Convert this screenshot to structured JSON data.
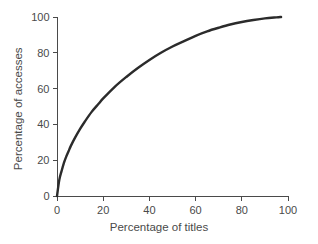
{
  "chart_data": {
    "type": "line",
    "title": "",
    "subtitle": "",
    "xlabel": "Percentage of titles",
    "ylabel": "Percentage of accesses",
    "xlim": [
      0,
      100
    ],
    "ylim": [
      0,
      100
    ],
    "xticks": [
      0,
      20,
      40,
      60,
      80,
      100
    ],
    "yticks": [
      0,
      20,
      40,
      60,
      80,
      100
    ],
    "xtick_labels": [
      "0",
      "20",
      "40",
      "60",
      "80",
      "100"
    ],
    "ytick_labels": [
      "0",
      "20",
      "40",
      "60",
      "80",
      "100"
    ],
    "grid": false,
    "legend": false,
    "legend_position": "none",
    "annotations": [],
    "line_color": "#2b2b2b",
    "line_width": 2.4,
    "background_color": "#ffffff",
    "axis_color": "#4a4a4a",
    "series": [
      {
        "name": "Cumulative accesses",
        "x": [
          0,
          1,
          2,
          3,
          4,
          5,
          6,
          8,
          10,
          12,
          15,
          18,
          20,
          25,
          30,
          35,
          40,
          45,
          50,
          55,
          60,
          65,
          70,
          75,
          80,
          85,
          90,
          95,
          97
        ],
        "y": [
          0,
          9,
          14,
          18.5,
          22,
          25,
          28,
          33,
          37.5,
          41.5,
          47,
          51.5,
          54.5,
          61,
          66.5,
          71.5,
          76,
          80,
          83.5,
          86.5,
          89.5,
          92,
          94,
          95.8,
          97.2,
          98.3,
          99.2,
          99.8,
          100
        ]
      }
    ]
  },
  "axis_titles": {
    "x": "Percentage of titles",
    "y": "Percentage of accesses"
  }
}
